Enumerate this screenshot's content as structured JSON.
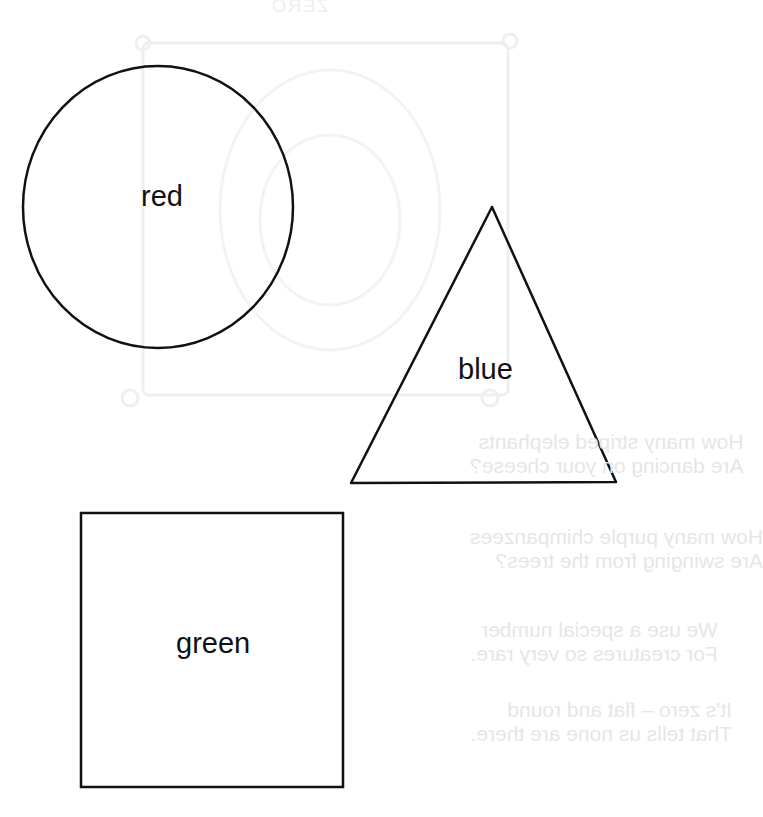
{
  "shapes": [
    {
      "type": "circle",
      "label": "red",
      "cx": 158,
      "cy": 207,
      "rx": 135,
      "ry": 141,
      "stroke": "#111111"
    },
    {
      "type": "triangle",
      "label": "blue",
      "points": [
        [
          492,
          207
        ],
        [
          351,
          483
        ],
        [
          616,
          482
        ]
      ],
      "stroke": "#111111"
    },
    {
      "type": "square",
      "label": "green",
      "x": 81,
      "y": 513,
      "width": 262,
      "height": 274,
      "stroke": "#111111"
    }
  ],
  "labels": {
    "circle": "red",
    "triangle": "blue",
    "square": "green"
  },
  "bleed_through": {
    "title": "ZERO",
    "stanzas": [
      {
        "lines": [
          "How many striped elephants",
          "Are dancing on your cheese?"
        ]
      },
      {
        "lines": [
          "How many purple chimpanzees",
          "Are swinging from the trees?"
        ]
      },
      {
        "lines": [
          "We use a special number",
          "For creatures so very rare."
        ]
      },
      {
        "lines": [
          "It's zero – flat and round",
          "That tells us none are there."
        ]
      }
    ],
    "color": "#e6e6e6"
  },
  "colors": {
    "background": "#ffffff",
    "outline": "#111111",
    "faint": "#ececec"
  }
}
